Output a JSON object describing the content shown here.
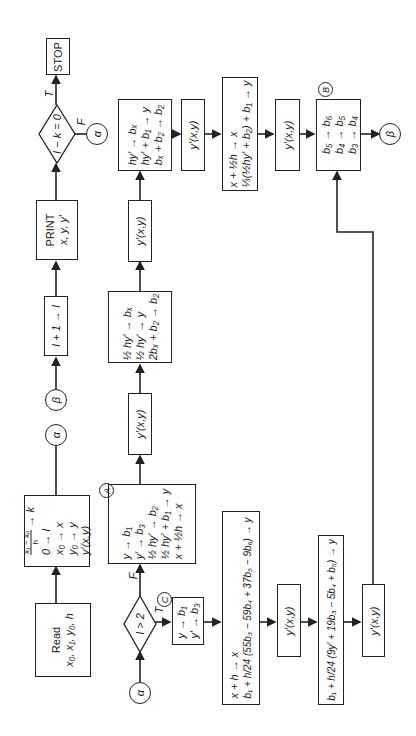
{
  "orientation": "rotated-90-ccw",
  "nodes": {
    "read": {
      "title": "Read",
      "params": "x₀, x₁, y₀, h"
    },
    "init": {
      "lines": [
        "(x₁ − x₀)/h → k",
        "0 → I",
        "x₀ → x",
        "y₀ → y",
        "y′(x,y)"
      ],
      "frac_num": "x₁ − x₀",
      "frac_den": "h",
      "frac_rest": "→ k"
    },
    "alpha_out_1": {
      "label": "α"
    },
    "beta_in": {
      "label": "β"
    },
    "increment": {
      "text": "I + 1 → I"
    },
    "print": {
      "title": "PRINT",
      "values": "x, y, y′"
    },
    "decision_end": {
      "text": "I − k = 0",
      "true_label": "T",
      "false_label": "F"
    },
    "alpha_from_end": {
      "label": "α"
    },
    "stop": {
      "text": "STOP"
    },
    "alpha_in": {
      "label": "α"
    },
    "decision_i2": {
      "text": "I > 2",
      "true_label": "T",
      "false_label": "F"
    },
    "box_a": {
      "tag": "A",
      "lines": [
        "y → b₁",
        "y′ → b₃",
        "½ hy′ → b₂",
        "½ hy′ + b₁ → y",
        "x + ½h → x"
      ]
    },
    "eval_a1": {
      "text": "y′(x,y)"
    },
    "box_half": {
      "lines": [
        "½ hy′ → bₓ",
        "½ hy′ → y",
        "2bₓ + b₂ → b₂"
      ]
    },
    "eval_a2": {
      "text": "y′(x,y)"
    },
    "box_hy": {
      "lines": [
        "hy′ → bₓ",
        "hy′ + b₁ → y",
        "bₓ + b₂ → b₂"
      ]
    },
    "box_c": {
      "tag": "C",
      "lines": [
        "y → b₁",
        "y′ → b₃"
      ]
    },
    "predictor": {
      "lines": [
        "x + h → x",
        "b₁ + h/24 (55b₃ − 59b₄ + 37b₅ − 9b₆) → y"
      ]
    },
    "eval_c1": {
      "text": "y′(x,y)"
    },
    "corrector": {
      "text": "b₁ + h/24 (9y′ + 19b₃ − 5b₄ + b₅) → y"
    },
    "eval_c2": {
      "text": "y′(x,y)"
    },
    "box_x_half": {
      "lines": [
        "x + ½h → x",
        "⅓(½hy′ + b₂) + b₁ → y"
      ]
    },
    "eval_b0": {
      "text": "y′(x,y)"
    },
    "box_b": {
      "tag": "B",
      "lines": [
        "b₅ → b₆",
        "b₄ → b₅",
        "b₃ → b₄"
      ]
    },
    "beta_out": {
      "label": "β"
    }
  }
}
